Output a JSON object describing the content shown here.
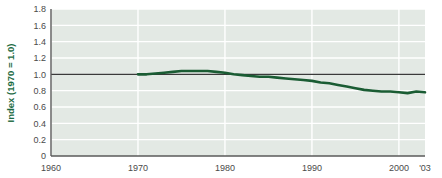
{
  "chart_data": {
    "type": "line",
    "title": "",
    "subtitle": "",
    "xlabel": "",
    "ylabel": "Index (1970 = 1.0)",
    "ylim": [
      0,
      1.8
    ],
    "xlim": [
      1960,
      2003
    ],
    "grid": true,
    "legend": false,
    "legend_position": "none",
    "y_ticks": [
      "1.8",
      "1.6",
      "1.4",
      "1.2",
      "1.0",
      "0.8",
      "0.6",
      "0.4",
      "0.2",
      "0"
    ],
    "y_tick_values": [
      1.8,
      1.6,
      1.4,
      1.2,
      1.0,
      0.8,
      0.6,
      0.4,
      0.2,
      0
    ],
    "x_ticks": [
      "1960",
      "1970",
      "1980",
      "1990",
      "2000",
      "'03"
    ],
    "x_tick_values": [
      1960,
      1970,
      1980,
      1990,
      2000,
      2003
    ],
    "reference_line": {
      "value": 1.0,
      "label": "",
      "color": "#3a3a3a"
    },
    "series": [
      {
        "name": "Index",
        "color": "#1a5c33",
        "x": [
          1970,
          1971,
          1972,
          1973,
          1974,
          1975,
          1976,
          1977,
          1978,
          1979,
          1980,
          1981,
          1982,
          1983,
          1984,
          1985,
          1986,
          1987,
          1988,
          1989,
          1990,
          1991,
          1992,
          1993,
          1994,
          1995,
          1996,
          1997,
          1998,
          1999,
          2000,
          2001,
          2002,
          2003
        ],
        "values": [
          1.0,
          1.0,
          1.01,
          1.02,
          1.03,
          1.04,
          1.04,
          1.04,
          1.04,
          1.03,
          1.02,
          1.0,
          0.99,
          0.98,
          0.97,
          0.97,
          0.96,
          0.95,
          0.94,
          0.93,
          0.92,
          0.9,
          0.89,
          0.87,
          0.85,
          0.83,
          0.81,
          0.8,
          0.79,
          0.79,
          0.78,
          0.77,
          0.79,
          0.78
        ]
      }
    ],
    "colors": {
      "plot_background": "#e3e9e4",
      "gridline": "#ffffff",
      "axis": "#5a5a5a",
      "series": "#1a5c33",
      "reference": "#3a3a3a",
      "label_accent": "#1c6b43",
      "tick_text": "#4a4a4a",
      "page_background": "#ffffff"
    }
  }
}
